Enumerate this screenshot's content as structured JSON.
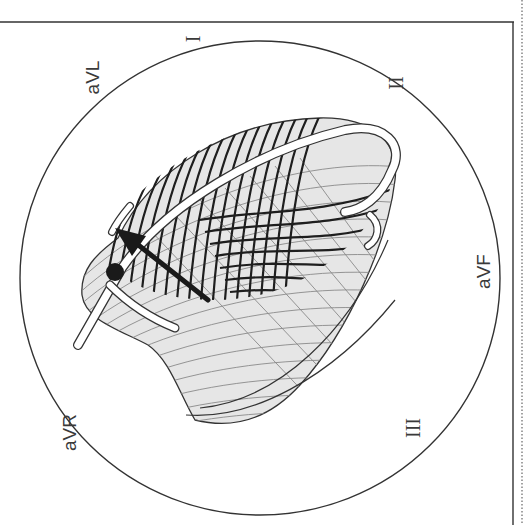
{
  "figure": {
    "type": "cardiac-conduction-diagram",
    "orientation": "rotated-90-ccw",
    "colors": {
      "background": "#ffffff",
      "line": "#333333",
      "heart_fill": "#e4e4e4",
      "hatch_dark": "#222222",
      "hatch_light": "#9a9a9a",
      "conduction_path": "#ffffff",
      "arrow": "#1a1a1a"
    }
  },
  "leads": [
    {
      "id": "aVL",
      "label": "aVL"
    },
    {
      "id": "I",
      "label": "I"
    },
    {
      "id": "II",
      "label": "II"
    },
    {
      "id": "aVF",
      "label": "aVF"
    },
    {
      "id": "III",
      "label": "III"
    },
    {
      "id": "aVR",
      "label": "aVR"
    }
  ],
  "elements": {
    "frame": "outer-rectangle",
    "circle": "hexaxial-reference-circle",
    "heart": "ventricles-with-isochrone-lines",
    "arrow": "mean-electrical-axis-vector",
    "node": "conduction-origin-dot"
  }
}
